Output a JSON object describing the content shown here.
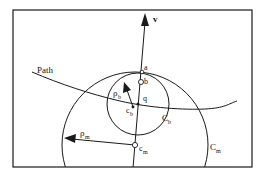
{
  "diagram": {
    "type": "geometric construction",
    "frame": {
      "x": 13,
      "y": 10,
      "w": 239,
      "h": 157
    },
    "labels": {
      "v": "v",
      "path": "Path",
      "a": "a",
      "b": "b",
      "q": "q",
      "c_b": "c",
      "c_b_sub": "b",
      "C_b": "C",
      "C_b_sub": "b",
      "rho_b": "ρ",
      "rho_b_sub": "b",
      "rho_m": "ρ",
      "rho_m_sub": "m",
      "c_m": "c",
      "c_m_sub": "m",
      "C_m": "C",
      "C_m_sub": "m"
    },
    "points": {
      "a": {
        "x": 142,
        "y": 72
      },
      "b": {
        "x": 141,
        "y": 82
      },
      "q": {
        "x": 138,
        "y": 104
      },
      "c_b": {
        "x": 133,
        "y": 107
      },
      "c_m": {
        "x": 135,
        "y": 145
      }
    },
    "circles": {
      "C_m": {
        "cx": 135,
        "cy": 145,
        "r": 73
      },
      "C_b": {
        "cx": 138,
        "cy": 104,
        "r": 31
      }
    },
    "colors": {
      "ink": "#1a1a1a",
      "background": "#ffffff"
    }
  }
}
